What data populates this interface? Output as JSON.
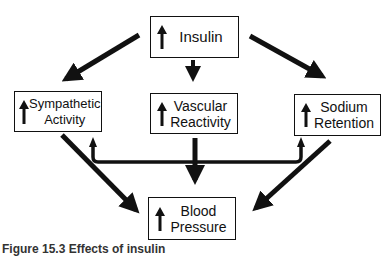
{
  "diagram": {
    "nodes": [
      {
        "id": "insulin",
        "label_lines": [
          "Insulin"
        ],
        "indicator": "up-arrow (increase)"
      },
      {
        "id": "sympathetic",
        "label_lines": [
          "Sympathetic",
          "Activity"
        ],
        "indicator": "up-arrow (increase)"
      },
      {
        "id": "vascular",
        "label_lines": [
          "Vascular",
          "Reactivity"
        ],
        "indicator": "up-arrow (increase)"
      },
      {
        "id": "sodium",
        "label_lines": [
          "Sodium",
          "Retention"
        ],
        "indicator": "up-arrow (increase)"
      },
      {
        "id": "bp",
        "label_lines": [
          "Blood",
          "Pressure"
        ],
        "indicator": "up-arrow (increase)"
      }
    ],
    "edges": [
      {
        "from": "insulin",
        "to": "sympathetic"
      },
      {
        "from": "insulin",
        "to": "vascular"
      },
      {
        "from": "insulin",
        "to": "sodium"
      },
      {
        "from": "sympathetic",
        "to": "bp"
      },
      {
        "from": "vascular",
        "to": "bp"
      },
      {
        "from": "sodium",
        "to": "bp"
      },
      {
        "from": "vascular",
        "to": "sympathetic",
        "via": "bracket"
      },
      {
        "from": "vascular",
        "to": "sodium",
        "via": "bracket"
      }
    ]
  },
  "boxes": {
    "insulin": {
      "line1": "Insulin"
    },
    "sympathetic": {
      "line1": "Sympathetic",
      "line2": "Activity"
    },
    "vascular": {
      "line1": "Vascular",
      "line2": "Reactivity"
    },
    "sodium": {
      "line1": "Sodium",
      "line2": "Retention"
    },
    "bp": {
      "line1": "Blood",
      "line2": "Pressure"
    }
  },
  "caption": "Figure 15.3 Effects of insulin"
}
